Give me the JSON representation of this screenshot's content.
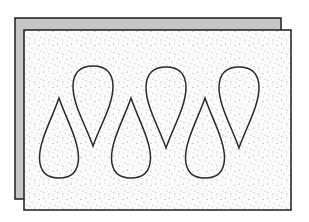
{
  "figure": {
    "colors": {
      "background": "#ffffff",
      "back_sheet_fill": "#c6c6c6",
      "outline": "#2a2a2a",
      "front_sheet_fill": "#fbfbfb",
      "stipple_dot": "#9a9a9a"
    },
    "back_sheet": {
      "x": 15,
      "y": 18,
      "w": 266,
      "h": 181
    },
    "front_sheet": {
      "x": 24,
      "y": 30,
      "w": 267,
      "h": 180
    },
    "drops": [
      {
        "orientation": "up",
        "cx": 59,
        "tip": 98,
        "base": 178,
        "half_width": 19.5
      },
      {
        "orientation": "down",
        "cx": 93,
        "tip": 146,
        "base": 66,
        "half_width": 20
      },
      {
        "orientation": "up",
        "cx": 131,
        "tip": 98,
        "base": 178,
        "half_width": 19.5
      },
      {
        "orientation": "down",
        "cx": 166,
        "tip": 148,
        "base": 67,
        "half_width": 20
      },
      {
        "orientation": "up",
        "cx": 205,
        "tip": 98,
        "base": 178,
        "half_width": 19.5
      },
      {
        "orientation": "down",
        "cx": 239,
        "tip": 148,
        "base": 67,
        "half_width": 20
      }
    ]
  }
}
